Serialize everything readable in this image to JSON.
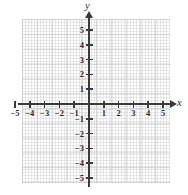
{
  "figure": {
    "kind": "cartesian-coordinate-grid",
    "title": "",
    "background_color": "#ffffff",
    "grid_color": "#d6d6d6",
    "axis_color": "#3a3a3a",
    "label_color": "#2b2b2b"
  },
  "axes": {
    "x": {
      "name": "x",
      "arrow": true,
      "range": [
        -5.5,
        5.5
      ],
      "ticks": [
        -5,
        -4,
        -3,
        -2,
        -1,
        1,
        2,
        3,
        4,
        5
      ],
      "tick_labels": [
        "−5",
        "−4",
        "−3",
        "−2",
        "−1",
        "1",
        "2",
        "3",
        "4",
        "5"
      ]
    },
    "y": {
      "name": "y",
      "arrow": true,
      "range": [
        -5.5,
        5.5
      ],
      "ticks": [
        5,
        4,
        3,
        2,
        1,
        -1,
        -2,
        -3,
        -4,
        -5
      ],
      "tick_labels": [
        "5",
        "4",
        "3",
        "2",
        "1",
        "−1",
        "−2",
        "−3",
        "−4",
        "−5"
      ]
    }
  },
  "chart_data": {
    "type": "scatter",
    "title": "",
    "xlabel": "x",
    "ylabel": "y",
    "xlim": [
      -5.5,
      5.5
    ],
    "ylim": [
      -5.5,
      5.5
    ],
    "grid": true,
    "legend": null,
    "x": [],
    "y": [],
    "series": [],
    "annotations": []
  }
}
